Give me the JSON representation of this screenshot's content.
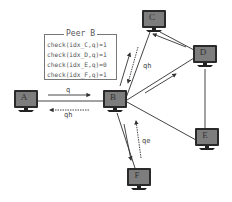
{
  "diagram": {
    "type": "peer-to-peer network query forwarding",
    "nodes": [
      {
        "id": "A",
        "label": "A",
        "x": 14,
        "y": 90
      },
      {
        "id": "B",
        "label": "B",
        "x": 103,
        "y": 90
      },
      {
        "id": "C",
        "label": "C",
        "x": 142,
        "y": 10
      },
      {
        "id": "D",
        "label": "D",
        "x": 193,
        "y": 45
      },
      {
        "id": "E",
        "label": "E",
        "x": 195,
        "y": 128
      },
      {
        "id": "F",
        "label": "F",
        "x": 127,
        "y": 168
      }
    ],
    "links": [
      [
        "A",
        "B"
      ],
      [
        "B",
        "C"
      ],
      [
        "B",
        "D"
      ],
      [
        "B",
        "E"
      ],
      [
        "B",
        "F"
      ],
      [
        "C",
        "D"
      ],
      [
        "D",
        "E"
      ]
    ],
    "messages": [
      {
        "from": "A",
        "to": "B",
        "label": "q",
        "style": "solid"
      },
      {
        "from": "B",
        "to": "A",
        "label": "qh",
        "style": "dashed"
      },
      {
        "from": "B",
        "to": "C",
        "label": "",
        "style": "solid"
      },
      {
        "from": "C",
        "to": "B",
        "label": "qh",
        "style": "dashed"
      },
      {
        "from": "B",
        "to": "D",
        "label": "",
        "style": "solid"
      },
      {
        "from": "D",
        "to": "C",
        "label": "",
        "style": "solid"
      },
      {
        "from": "B",
        "to": "F",
        "label": "",
        "style": "solid"
      },
      {
        "from": "F",
        "to": "B",
        "label": "qe",
        "style": "dashed"
      }
    ],
    "peer_box": {
      "title": "Peer B",
      "lines": [
        "check(idx_C,q)=1",
        "check(idx_D,q)=1",
        "check(idx_E,q)=0",
        "check(idx_F,q)=1"
      ]
    },
    "labels": {
      "ab_q": "q",
      "ba_qh": "qh",
      "cb_qh": "qh",
      "fb_qe": "qe"
    },
    "colors": {
      "line": "#333333",
      "monitor_frame": "#2a2a2a",
      "monitor_screen": "#7d7d7d",
      "text": "#555555"
    }
  }
}
